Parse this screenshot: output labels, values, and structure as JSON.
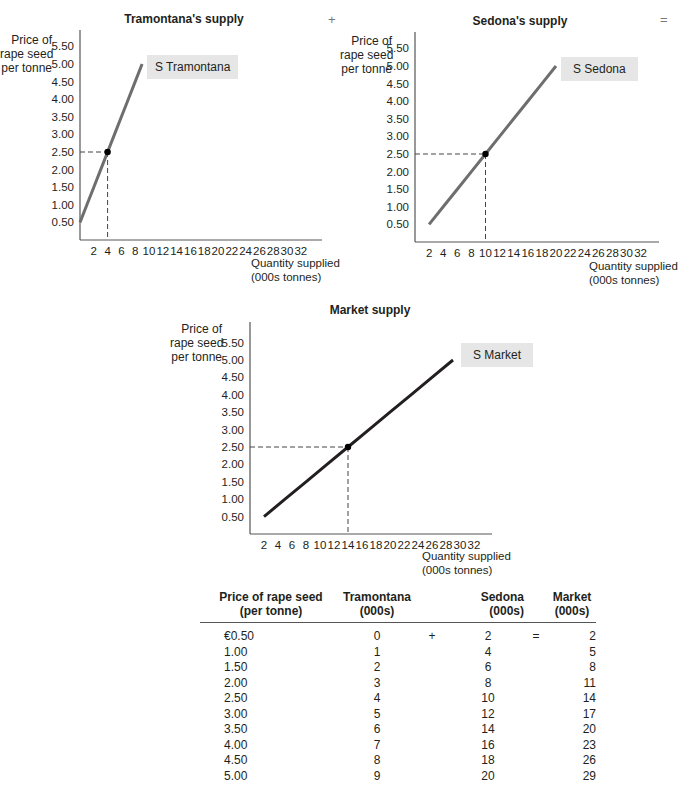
{
  "operators": {
    "plus": "+",
    "equals": "="
  },
  "axis_text": {
    "ylabel_line1": "Price of",
    "ylabel_line2": "rape seed",
    "ylabel_line3": "per tonne",
    "xlabel_line1": "Quantity supplied",
    "xlabel_line2": "(000s tonnes)"
  },
  "chart_data": [
    {
      "type": "line",
      "title": "Tramontana's supply",
      "xlabel": "Quantity supplied (000s tonnes)",
      "ylabel": "Price of rape seed per tonne",
      "x_ticks": [
        2,
        4,
        6,
        8,
        10,
        12,
        14,
        16,
        18,
        20,
        22,
        24,
        26,
        28,
        30,
        32
      ],
      "y_ticks": [
        "0.50",
        "1.00",
        "1.50",
        "2.00",
        "2.50",
        "3.00",
        "3.50",
        "4.00",
        "4.50",
        "5.00",
        "5.50"
      ],
      "xlim": [
        0,
        34
      ],
      "ylim": [
        0,
        5.9
      ],
      "series": [
        {
          "name": "S Tramontana",
          "x": [
            0,
            1,
            2,
            3,
            4,
            5,
            6,
            7,
            8,
            9
          ],
          "y": [
            0.5,
            1.0,
            1.5,
            2.0,
            2.5,
            3.0,
            3.5,
            4.0,
            4.5,
            5.0
          ]
        }
      ],
      "highlight_point": {
        "x": 4,
        "y": 2.5
      },
      "curve_label": "S Tramontana",
      "line_color": "#6d6e70",
      "grid": false
    },
    {
      "type": "line",
      "title": "Sedona's supply",
      "xlabel": "Quantity supplied (000s tonnes)",
      "ylabel": "Price of rape seed per tonne",
      "x_ticks": [
        2,
        4,
        6,
        8,
        10,
        12,
        14,
        16,
        18,
        20,
        22,
        24,
        26,
        28,
        30,
        32
      ],
      "y_ticks": [
        "0.50",
        "1.00",
        "1.50",
        "2.00",
        "2.50",
        "3.00",
        "3.50",
        "4.00",
        "4.50",
        "5.00",
        "5.50"
      ],
      "xlim": [
        0,
        34
      ],
      "ylim": [
        0,
        5.9
      ],
      "series": [
        {
          "name": "S Sedona",
          "x": [
            2,
            4,
            6,
            8,
            10,
            12,
            14,
            16,
            18,
            20
          ],
          "y": [
            0.5,
            1.0,
            1.5,
            2.0,
            2.5,
            3.0,
            3.5,
            4.0,
            4.5,
            5.0
          ]
        }
      ],
      "highlight_point": {
        "x": 10,
        "y": 2.5
      },
      "curve_label": "S Sedona",
      "line_color": "#6d6e70",
      "grid": false
    },
    {
      "type": "line",
      "title": "Market supply",
      "xlabel": "Quantity supplied (000s tonnes)",
      "ylabel": "Price of rape seed per tonne",
      "x_ticks": [
        2,
        4,
        6,
        8,
        10,
        12,
        14,
        16,
        18,
        20,
        22,
        24,
        26,
        28,
        30,
        32
      ],
      "y_ticks": [
        "0.50",
        "1.00",
        "1.50",
        "2.00",
        "2.50",
        "3.00",
        "3.50",
        "4.00",
        "4.50",
        "5.00",
        "5.50"
      ],
      "xlim": [
        0,
        34
      ],
      "ylim": [
        0,
        5.9
      ],
      "series": [
        {
          "name": "S Market",
          "x": [
            2,
            5,
            8,
            11,
            14,
            17,
            20,
            23,
            26,
            29
          ],
          "y": [
            0.5,
            1.0,
            1.5,
            2.0,
            2.5,
            3.0,
            3.5,
            4.0,
            4.5,
            5.0
          ]
        }
      ],
      "highlight_point": {
        "x": 14,
        "y": 2.5
      },
      "curve_label": "S Market",
      "line_color": "#231f20",
      "grid": false
    },
    {
      "type": "table",
      "columns": [
        "Price of rape seed (per tonne)",
        "Tramontana (000s)",
        "Sedona (000s)",
        "Market (000s)"
      ],
      "rows": [
        [
          "€0.50",
          0,
          2,
          2
        ],
        [
          "1.00",
          1,
          4,
          5
        ],
        [
          "1.50",
          2,
          6,
          8
        ],
        [
          "2.00",
          3,
          8,
          11
        ],
        [
          "2.50",
          4,
          10,
          14
        ],
        [
          "3.00",
          5,
          12,
          17
        ],
        [
          "3.50",
          6,
          14,
          20
        ],
        [
          "4.00",
          7,
          16,
          23
        ],
        [
          "4.50",
          8,
          18,
          26
        ],
        [
          "5.00",
          9,
          20,
          29
        ]
      ]
    }
  ],
  "table": {
    "headers": {
      "price_l1": "Price of rape seed",
      "price_l2": "(per tonne)",
      "tram_l1": "Tramontana",
      "tram_l2": "(000s)",
      "sed_l1": "Sedona",
      "sed_l2": "(000s)",
      "mkt_l1": "Market",
      "mkt_l2": "(000s)"
    },
    "first_row_plus": "+",
    "first_row_equals": "="
  }
}
